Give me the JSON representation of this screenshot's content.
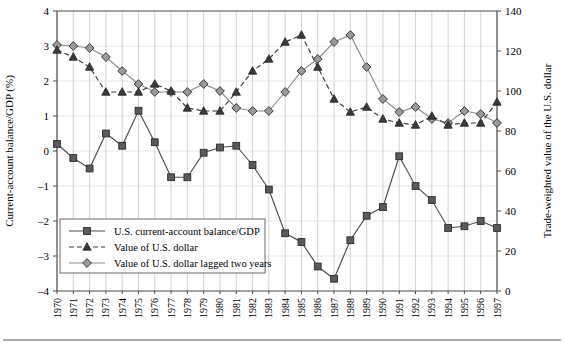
{
  "chart_data": {
    "type": "line",
    "title": "",
    "subtitle": "",
    "x": [
      1970,
      1971,
      1972,
      1973,
      1974,
      1975,
      1976,
      1977,
      1978,
      1979,
      1980,
      1981,
      1982,
      1983,
      1984,
      1985,
      1986,
      1987,
      1988,
      1989,
      1990,
      1991,
      1992,
      1993,
      1994,
      1995,
      1996,
      1997
    ],
    "xlabel": "",
    "ylabel": "Current-account balance/GDP (%)",
    "y2label": "Trade-weighted value of the U.S. dollar",
    "ylim": [
      -4,
      4
    ],
    "y2lim": [
      0,
      140
    ],
    "yticks": [
      "4",
      "3",
      "2",
      "1",
      "0",
      "-1",
      "-2",
      "-3",
      "-4"
    ],
    "ytick_values": [
      4,
      3,
      2,
      1,
      0,
      -1,
      -2,
      -3,
      -4
    ],
    "y2ticks": [
      "140",
      "120",
      "100",
      "80",
      "60",
      "40",
      "20",
      "0"
    ],
    "y2tick_values": [
      140,
      120,
      100,
      80,
      60,
      40,
      20,
      0
    ],
    "xtick_labels": [
      "1970",
      "1971",
      "1972",
      "1973",
      "1974",
      "1975",
      "1976",
      "1977",
      "1978",
      "1979",
      "1980",
      "1981",
      "1982",
      "1983",
      "1984",
      "1985",
      "1986",
      "1987",
      "1988",
      "1989",
      "1990",
      "1991",
      "1992",
      "1993",
      "1994",
      "1995",
      "1996",
      "1997"
    ],
    "grid": "vertical",
    "legend_position": "lower-left-inside",
    "series": [
      {
        "name": "U.S. current-account balance/GDP",
        "axis": "left",
        "marker": "square",
        "linestyle": "solid",
        "color": "#4d4d4d",
        "marker_fill": "#5a5a5a",
        "values": [
          0.2,
          -0.2,
          -0.5,
          0.5,
          0.15,
          1.15,
          0.25,
          -0.75,
          -0.75,
          -0.05,
          0.1,
          0.15,
          -0.4,
          -1.1,
          -2.35,
          -2.6,
          -3.3,
          -3.65,
          -2.55,
          -1.85,
          -1.6,
          -0.15,
          -1.0,
          -1.4,
          -2.2,
          -2.15,
          -2.0,
          -2.2
        ]
      },
      {
        "name": "Value of U.S. dollar",
        "axis": "right",
        "marker": "triangle",
        "linestyle": "dashed",
        "color": "#3a3a3a",
        "marker_fill": "#3a3a3a",
        "values": [
          120.5,
          117.0,
          112.0,
          99.5,
          99.5,
          99.5,
          103.5,
          100.0,
          91.5,
          90.0,
          90.0,
          99.5,
          110.0,
          116.0,
          124.5,
          128.0,
          112.0,
          96.0,
          89.5,
          92.0,
          86.0,
          84.0,
          83.0,
          87.5,
          83.0,
          84.0,
          84.0,
          94.5
        ]
      },
      {
        "name": "Value of U.S. dollar lagged two years",
        "axis": "right",
        "marker": "diamond",
        "linestyle": "solid",
        "color": "#8c8c8c",
        "marker_fill": "#9a9a9a",
        "values": [
          123.0,
          122.5,
          121.5,
          117.0,
          110.0,
          103.5,
          99.5,
          99.5,
          99.5,
          103.5,
          100.0,
          91.5,
          90.0,
          90.0,
          99.5,
          110.0,
          116.0,
          124.5,
          128.0,
          112.0,
          96.0,
          89.5,
          92.0,
          86.0,
          84.0,
          90.0,
          88.5,
          84.0
        ]
      }
    ]
  },
  "legend": {
    "items": [
      {
        "label": "U.S. current-account balance/GDP",
        "marker": "square"
      },
      {
        "label": "Value of U.S. dollar",
        "marker": "triangle"
      },
      {
        "label": "Value of U.S. dollar lagged two years",
        "marker": "diamond"
      }
    ]
  }
}
